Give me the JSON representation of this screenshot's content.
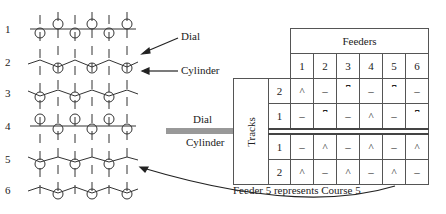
{
  "diagram": {
    "labels": {
      "dial": "Dial",
      "cylinder": "Cylinder",
      "mid_dial": "Dial",
      "mid_cylinder": "Cylinder",
      "caption": "Feeder 5 represents Course 5"
    },
    "courses": [
      {
        "number": "1",
        "type": "rib: dial and cylinder tucks alternate"
      },
      {
        "number": "2",
        "type": "cylinder knit on alternate needles"
      },
      {
        "number": "3",
        "type": "cylinder knit on alternate needles"
      },
      {
        "number": "4",
        "type": "rib: dial and cylinder tucks alternate"
      },
      {
        "number": "5",
        "type": "cylinder knit on alternate needles"
      },
      {
        "number": "6",
        "type": "cylinder knit on alternate needles"
      }
    ],
    "table": {
      "header": "Feeders",
      "side_header": "Tracks",
      "feeder_numbers": [
        "1",
        "2",
        "3",
        "4",
        "5",
        "6"
      ],
      "dial_rows": [
        {
          "track": "2",
          "cells": [
            "^",
            "–",
            "⎴",
            "–",
            "⎴",
            "–"
          ]
        },
        {
          "track": "1",
          "cells": [
            "–",
            "⎴",
            "–",
            "^",
            "–",
            "⎴"
          ]
        }
      ],
      "cylinder_rows": [
        {
          "track": "1",
          "cells": [
            "–",
            "^",
            "–",
            "^",
            "–",
            "^"
          ]
        },
        {
          "track": "2",
          "cells": [
            "^",
            "–",
            "^",
            "–",
            "^",
            "–"
          ]
        }
      ]
    }
  }
}
